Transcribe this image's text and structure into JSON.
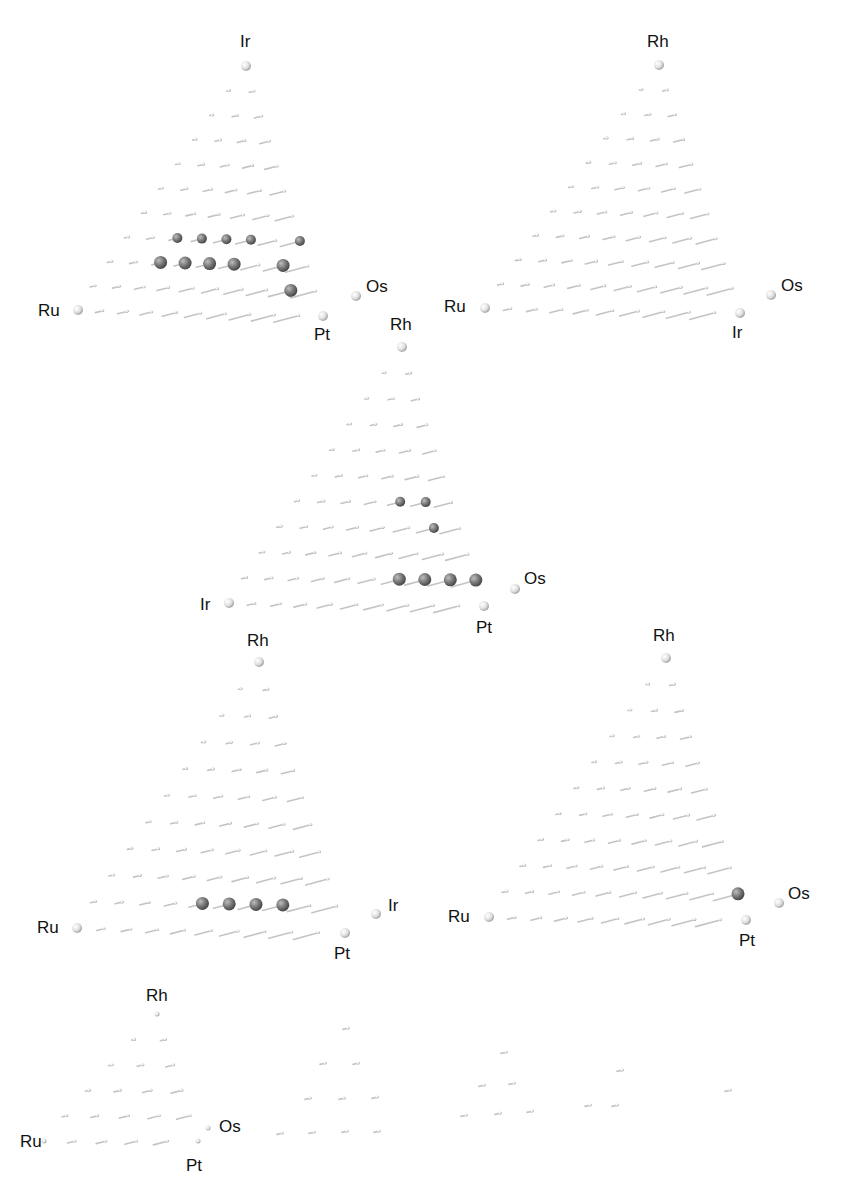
{
  "figure": {
    "panels": [
      {
        "id": "top-left",
        "apex": {
          "label": "Ir",
          "x": 246,
          "y": 66
        },
        "left": {
          "label": "Ru",
          "x": 78,
          "y": 310
        },
        "right_top": {
          "label": "Os",
          "x": 356,
          "y": 296
        },
        "right_bottom": {
          "label": "Pt",
          "x": 323,
          "y": 316
        },
        "labels": [
          {
            "text": "Ir",
            "x": 240,
            "y": 33
          },
          {
            "text": "Ru",
            "x": 38,
            "y": 302
          },
          {
            "text": "Os",
            "x": 366,
            "y": 278
          },
          {
            "text": "Pt",
            "x": 314,
            "y": 326
          }
        ],
        "rows": 10,
        "highlighted": [
          [
            7,
            2
          ],
          [
            7,
            3
          ],
          [
            7,
            4
          ],
          [
            7,
            5
          ],
          [
            8,
            2
          ],
          [
            8,
            3
          ],
          [
            8,
            4
          ],
          [
            8,
            5
          ],
          [
            6,
            7
          ],
          [
            7,
            7
          ],
          [
            8,
            7
          ],
          [
            9,
            8
          ]
        ]
      },
      {
        "id": "top-right",
        "apex": {
          "label": "Rh",
          "x": 659,
          "y": 65
        },
        "left": {
          "label": "Ru",
          "x": 485,
          "y": 308
        },
        "right_top": {
          "label": "Os",
          "x": 771,
          "y": 295
        },
        "right_bottom": {
          "label": "Ir",
          "x": 740,
          "y": 313
        },
        "labels": [
          {
            "text": "Rh",
            "x": 647,
            "y": 33
          },
          {
            "text": "Ru",
            "x": 444,
            "y": 298
          },
          {
            "text": "Os",
            "x": 781,
            "y": 277
          },
          {
            "text": "Ir",
            "x": 732,
            "y": 324
          }
        ],
        "rows": 10,
        "highlighted": []
      },
      {
        "id": "middle",
        "apex": {
          "label": "Rh",
          "x": 402,
          "y": 347
        },
        "left": {
          "label": "Ir",
          "x": 229,
          "y": 603
        },
        "right_top": {
          "label": "Os",
          "x": 515,
          "y": 589
        },
        "right_bottom": {
          "label": "Pt",
          "x": 484,
          "y": 606
        },
        "labels": [
          {
            "text": "Rh",
            "x": 390,
            "y": 316
          },
          {
            "text": "Ir",
            "x": 200,
            "y": 596
          },
          {
            "text": "Os",
            "x": 524,
            "y": 570
          },
          {
            "text": "Pt",
            "x": 476,
            "y": 619
          }
        ],
        "rows": 10,
        "highlighted": [
          [
            6,
            4
          ],
          [
            6,
            5
          ],
          [
            7,
            6
          ],
          [
            9,
            6
          ],
          [
            9,
            7
          ],
          [
            9,
            8
          ],
          [
            9,
            9
          ]
        ]
      },
      {
        "id": "bottom-left",
        "apex": {
          "label": "Rh",
          "x": 259,
          "y": 662
        },
        "left": {
          "label": "Ru",
          "x": 77,
          "y": 928
        },
        "right_top": {
          "label": "Ir",
          "x": 376,
          "y": 914
        },
        "right_bottom": {
          "label": "Pt",
          "x": 345,
          "y": 933
        },
        "labels": [
          {
            "text": "Rh",
            "x": 247,
            "y": 632
          },
          {
            "text": "Ru",
            "x": 37,
            "y": 919
          },
          {
            "text": "Ir",
            "x": 388,
            "y": 897
          },
          {
            "text": "Pt",
            "x": 334,
            "y": 945
          }
        ],
        "rows": 10,
        "highlighted": [
          [
            9,
            4
          ],
          [
            9,
            5
          ],
          [
            9,
            6
          ],
          [
            9,
            7
          ]
        ]
      },
      {
        "id": "bottom-right",
        "apex": {
          "label": "Rh",
          "x": 666,
          "y": 658
        },
        "left": {
          "label": "Ru",
          "x": 489,
          "y": 917
        },
        "right_top": {
          "label": "Os",
          "x": 779,
          "y": 903
        },
        "right_bottom": {
          "label": "Pt",
          "x": 746,
          "y": 920
        },
        "labels": [
          {
            "text": "Rh",
            "x": 653,
            "y": 627
          },
          {
            "text": "Ru",
            "x": 448,
            "y": 908
          },
          {
            "text": "Os",
            "x": 788,
            "y": 885
          },
          {
            "text": "Pt",
            "x": 739,
            "y": 932
          }
        ],
        "rows": 10,
        "highlighted": [
          [
            9,
            9
          ]
        ]
      },
      {
        "id": "bottom-partial",
        "apex": {
          "label": "Rh",
          "x": 157,
          "y": 1014
        },
        "left": {
          "label": "Ru",
          "x": 44,
          "y": 1141
        },
        "right_top": {
          "label": "Os",
          "x": 208,
          "y": 1128
        },
        "right_bottom": {
          "label": "Pt",
          "x": 198,
          "y": 1141
        },
        "labels": [
          {
            "text": "Rh",
            "x": 146,
            "y": 987
          },
          {
            "text": "Ru",
            "x": 20,
            "y": 1133
          },
          {
            "text": "Os",
            "x": 219,
            "y": 1118
          },
          {
            "text": "Pt",
            "x": 186,
            "y": 1157
          }
        ],
        "rows": 5,
        "highlighted": []
      }
    ],
    "extra_dots": [
      [
        348,
        1028
      ],
      [
        325,
        1063
      ],
      [
        358,
        1063
      ],
      [
        310,
        1098
      ],
      [
        344,
        1098
      ],
      [
        377,
        1097
      ],
      [
        282,
        1133
      ],
      [
        314,
        1132
      ],
      [
        347,
        1131
      ],
      [
        379,
        1131
      ],
      [
        506,
        1052
      ],
      [
        484,
        1085
      ],
      [
        514,
        1083
      ],
      [
        466,
        1115
      ],
      [
        500,
        1113
      ],
      [
        532,
        1111
      ],
      [
        622,
        1070
      ],
      [
        590,
        1105
      ],
      [
        617,
        1105
      ],
      [
        730,
        1090
      ]
    ]
  }
}
